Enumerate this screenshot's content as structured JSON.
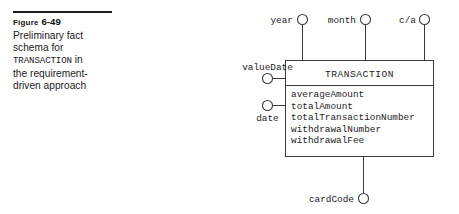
{
  "caption": {
    "figure_label": "Figure",
    "figure_number": "6-49",
    "line1": "Preliminary fact",
    "line2": "schema for",
    "line3_mono": "TRANSACTION",
    "line3_rest": " in",
    "line4": "the requirement-",
    "line5": "driven approach"
  },
  "diagram": {
    "fact_name": "TRANSACTION",
    "measures": [
      "averageAmount",
      "totalAmount",
      "totalTransactionNumber",
      "withdrawalNumber",
      "withdrawalFee"
    ],
    "dimensions_top": [
      {
        "label": "year"
      },
      {
        "label": "month"
      },
      {
        "label": "c/a"
      }
    ],
    "dimensions_left": [
      {
        "label": "valueDate"
      },
      {
        "label": "date"
      }
    ],
    "dimensions_bottom": [
      {
        "label": "cardCode"
      }
    ]
  },
  "colors": {
    "stroke": "#3a3a3a",
    "text": "#1b1b1b",
    "rule": "#1b1b1b",
    "background": "#ffffff"
  }
}
